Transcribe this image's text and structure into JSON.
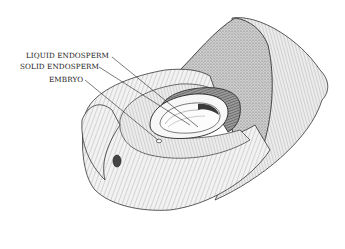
{
  "figure": {
    "labels": [
      {
        "id": "liquid-endosperm",
        "text": "LIQUID ENDOSPERM"
      },
      {
        "id": "solid-endosperm",
        "text": "SOLID ENDOSPERM"
      },
      {
        "id": "embryo",
        "text": "EMBRYO"
      }
    ],
    "colors": {
      "ink": "#1a1a1a",
      "background": "#ffffff",
      "husk_fill": "#e6e6e6",
      "shell_fill": "#bdbdbd",
      "endosperm_fill": "#f7f7f7"
    }
  }
}
